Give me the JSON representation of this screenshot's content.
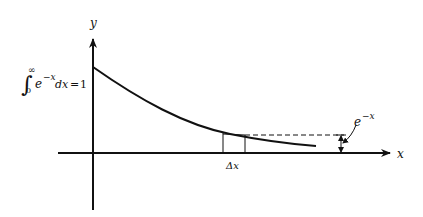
{
  "diagram": {
    "axis_y_label": "y",
    "axis_x_label": "x",
    "integral": {
      "symbol": "∫",
      "lower": "0",
      "upper": "∞",
      "integrand_base": "e",
      "integrand_exp": "−x",
      "differential": "dx",
      "equals": "=",
      "result": "1"
    },
    "strip_label": "Δx",
    "curve_label": {
      "base": "e",
      "exp": "−x"
    },
    "colors": {
      "stroke": "#111111",
      "background": "#ffffff"
    }
  }
}
